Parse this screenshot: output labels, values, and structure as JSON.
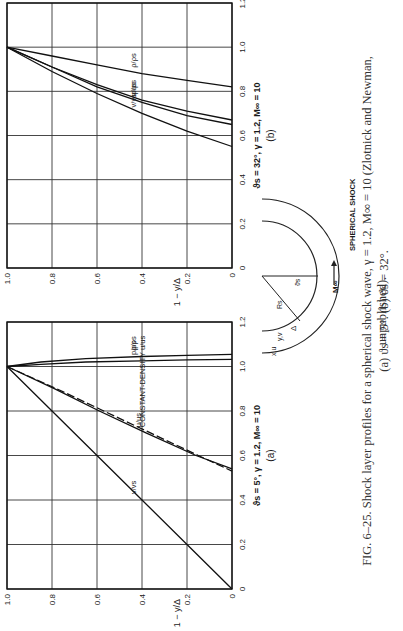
{
  "figure": {
    "caption_line1": "FIG. 6–25.  Shock layer profiles for a spherical shock wave, γ = 1.2, M∞ = 10 (Zlotnick and Newman, unpublished).",
    "caption_line2": "(a) ϑs = 5°.  (b) ϑs = 32°.",
    "inset": {
      "labels": [
        "x,u",
        "y,v",
        "Δ",
        "Rs",
        "ϑs",
        "M∞"
      ],
      "shock_label": "SPHERICAL SHOCK"
    }
  },
  "chart_data": [
    {
      "type": "line",
      "panel": "(a)",
      "subtitle": "ϑs = 5°, γ = 1.2, M∞ = 10",
      "xlabel": "",
      "ylabel": "1 − y/Δ",
      "xlim": [
        0,
        1.2
      ],
      "ylim": [
        0,
        1.0
      ],
      "xticks": [
        "0",
        "0.2",
        "0.4",
        "0.6",
        "0.8",
        "1.0",
        "1.2"
      ],
      "yticks": [
        "0",
        "0.2",
        "0.4",
        "0.6",
        "0.8",
        "1.0"
      ],
      "grid": true,
      "series": [
        {
          "name": "ρ/ρs",
          "x": [
            1.0,
            1.02,
            1.035,
            1.045,
            1.05,
            1.055
          ],
          "y": [
            1.0,
            0.85,
            0.65,
            0.4,
            0.2,
            0.0
          ]
        },
        {
          "name": "p/ps",
          "x": [
            1.0,
            1.01,
            1.02,
            1.025,
            1.03,
            1.032
          ],
          "y": [
            1.0,
            0.85,
            0.65,
            0.4,
            0.2,
            0.0
          ]
        },
        {
          "name": "u/us",
          "x": [
            1.0,
            0.9,
            0.8,
            0.7,
            0.6,
            0.54
          ],
          "y": [
            1.0,
            0.79,
            0.59,
            0.38,
            0.16,
            0.0
          ]
        },
        {
          "name": "CONSTANT-DENSITY u/us",
          "style": "dashed",
          "x": [
            1.0,
            0.9,
            0.8,
            0.7,
            0.6,
            0.53
          ],
          "y": [
            1.0,
            0.78,
            0.57,
            0.36,
            0.15,
            0.0
          ]
        },
        {
          "name": "v/vs",
          "x": [
            1.0,
            0.8,
            0.6,
            0.4,
            0.2,
            0.0
          ],
          "y": [
            1.0,
            0.8,
            0.6,
            0.4,
            0.2,
            0.0
          ]
        }
      ]
    },
    {
      "type": "line",
      "panel": "(b)",
      "subtitle": "ϑs = 32°, γ = 1.2, M∞ = 10",
      "xlabel": "",
      "ylabel": "1 − y/Δ",
      "xlim": [
        0,
        1.2
      ],
      "ylim": [
        0,
        1.0
      ],
      "xticks": [
        "0",
        "0.2",
        "0.4",
        "0.6",
        "0.8",
        "1.0",
        "1.2"
      ],
      "yticks": [
        "0",
        "0.2",
        "0.4",
        "0.6",
        "0.8",
        "1.0"
      ],
      "grid": true,
      "series": [
        {
          "name": "ρ/ρs",
          "x": [
            1.0,
            0.96,
            0.92,
            0.88,
            0.85,
            0.82
          ],
          "y": [
            1.0,
            0.8,
            0.6,
            0.4,
            0.2,
            0.0
          ]
        },
        {
          "name": "p/ps",
          "x": [
            1.0,
            0.91,
            0.83,
            0.76,
            0.71,
            0.67
          ],
          "y": [
            1.0,
            0.8,
            0.6,
            0.4,
            0.2,
            0.0
          ]
        },
        {
          "name": "u/us",
          "x": [
            1.0,
            0.91,
            0.82,
            0.75,
            0.69,
            0.65
          ],
          "y": [
            1.0,
            0.8,
            0.6,
            0.4,
            0.2,
            0.0
          ]
        },
        {
          "name": "v/vs",
          "x": [
            1.0,
            0.89,
            0.79,
            0.7,
            0.62,
            0.55
          ],
          "y": [
            1.0,
            0.8,
            0.6,
            0.4,
            0.2,
            0.0
          ]
        }
      ]
    }
  ]
}
